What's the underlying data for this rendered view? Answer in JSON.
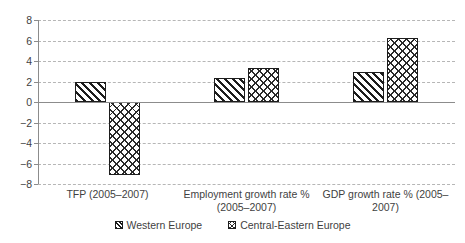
{
  "chart_data": {
    "type": "bar",
    "title": "",
    "subtitle": "",
    "xlabel": "",
    "ylabel": "",
    "categories": [
      "TFP (2005–2007)",
      "Employment growth rate % (2005–2007)",
      "GDP growth rate % (2005–2007)"
    ],
    "series": [
      {
        "name": "Western Europe",
        "pattern": "diagonal-hatch",
        "values": [
          2.0,
          2.3,
          2.9
        ]
      },
      {
        "name": "Central-Eastern Europe",
        "pattern": "cross-hatch",
        "values": [
          -7.1,
          3.3,
          6.2
        ]
      }
    ],
    "ylim": [
      -8,
      8
    ],
    "ytick_values": [
      8,
      6,
      4,
      2,
      0,
      -2,
      -4,
      -6,
      -8
    ],
    "ytick_labels": [
      "8",
      "6",
      "4",
      "2",
      "0",
      "−2",
      "−4",
      "−6",
      "−8"
    ],
    "grid": true,
    "grid_style": "dashed",
    "grid_color": "#b6b6b6",
    "zero_line_color": "#8c8c8c",
    "axis_color": "#8c8c8c",
    "bar_edge_color": "#1d1d1d",
    "bar_fill_color": "#ffffff",
    "text_color": "#3f3f3f",
    "legend_position": "bottom-center"
  },
  "legend": {
    "entries": [
      {
        "label": "Western Europe"
      },
      {
        "label": "Central-Eastern Europe"
      }
    ]
  },
  "category_labels": [
    {
      "line1": "TFP (2005–2007)",
      "line2": ""
    },
    {
      "line1": "Employment growth rate %",
      "line2": "(2005–2007)"
    },
    {
      "line1": "GDP growth rate % (2005–",
      "line2": "2007)"
    }
  ]
}
